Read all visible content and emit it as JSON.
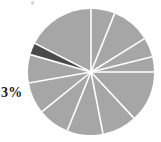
{
  "figure": {
    "kind": "pie-chart-image",
    "background_color": "#ffffff",
    "width": 161,
    "height": 142
  },
  "labels": {
    "highlighted_slice": "3%"
  },
  "colors": {
    "slice_gray": "#a6a6a6",
    "slice_dark": "#4a4a4a",
    "separator": "#ffffff",
    "label_text": "#1d1d1d",
    "artifact": "#c9c9c9"
  },
  "chart_data": {
    "type": "pie",
    "title": "",
    "subtitle": "",
    "xlabel": "",
    "ylabel": "",
    "legend": [],
    "legend_position": "none",
    "grid": false,
    "center": {
      "x": 91,
      "y": 72
    },
    "radius": 63,
    "start_angle_deg": -90,
    "direction": "clockwise",
    "labels": [
      "3%"
    ],
    "annotations": [
      {
        "text": "3%",
        "target_slice": "dark-wedge",
        "position": "left-outside",
        "x": 3,
        "y": 93
      }
    ],
    "categories": [
      "slice-1",
      "slice-2",
      "slice-3",
      "slice-4",
      "slice-5",
      "slice-6",
      "slice-7",
      "slice-8",
      "slice-9",
      "slice-10",
      "slice-11",
      "slice-12"
    ],
    "values": [
      6,
      10,
      5,
      4,
      13,
      9,
      9,
      8,
      8,
      10,
      3,
      15
    ],
    "slices": [
      {
        "name": "slice-1",
        "value": 6,
        "percent": 6,
        "start_deg": -90,
        "end_deg": -68,
        "color": "#a6a6a6",
        "label": ""
      },
      {
        "name": "slice-2",
        "value": 10,
        "percent": 10,
        "start_deg": -68,
        "end_deg": -32,
        "color": "#a6a6a6",
        "label": ""
      },
      {
        "name": "slice-3",
        "value": 5,
        "percent": 5,
        "start_deg": -32,
        "end_deg": -14,
        "color": "#a6a6a6",
        "label": ""
      },
      {
        "name": "slice-4",
        "value": 4,
        "percent": 4,
        "start_deg": -14,
        "end_deg": 0,
        "color": "#a6a6a6",
        "label": ""
      },
      {
        "name": "slice-5",
        "value": 13,
        "percent": 13,
        "start_deg": 0,
        "end_deg": 47,
        "color": "#a6a6a6",
        "label": ""
      },
      {
        "name": "slice-6",
        "value": 9,
        "percent": 9,
        "start_deg": 47,
        "end_deg": 79,
        "color": "#a6a6a6",
        "label": ""
      },
      {
        "name": "slice-7",
        "value": 9,
        "percent": 9,
        "start_deg": 79,
        "end_deg": 112,
        "color": "#a6a6a6",
        "label": ""
      },
      {
        "name": "slice-8",
        "value": 8,
        "percent": 8,
        "start_deg": 112,
        "end_deg": 141,
        "color": "#a6a6a6",
        "label": ""
      },
      {
        "name": "slice-9",
        "value": 8,
        "percent": 8,
        "start_deg": 141,
        "end_deg": 170,
        "color": "#a6a6a6",
        "label": ""
      },
      {
        "name": "slice-10",
        "value": 10,
        "percent": 10,
        "start_deg": 170,
        "end_deg": 196,
        "color": "#a6a6a6",
        "label": ""
      },
      {
        "name": "slice-11",
        "value": 3,
        "percent": 3,
        "start_deg": 196,
        "end_deg": 207,
        "color": "#4a4a4a",
        "label": "3%"
      },
      {
        "name": "slice-12",
        "value": 15,
        "percent": 15,
        "start_deg": 207,
        "end_deg": 270,
        "color": "#a6a6a6",
        "label": ""
      }
    ]
  }
}
